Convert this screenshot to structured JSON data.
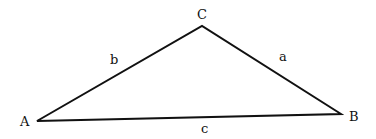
{
  "diagram": {
    "type": "triangle",
    "stroke_color": "#111111",
    "vertices": {
      "A": {
        "label": "A",
        "x": 37,
        "y": 121
      },
      "B": {
        "label": "B",
        "x": 341,
        "y": 114
      },
      "C": {
        "label": "C",
        "x": 202,
        "y": 26
      }
    },
    "sides": {
      "a": {
        "label": "a",
        "from": "C",
        "to": "B"
      },
      "b": {
        "label": "b",
        "from": "A",
        "to": "C"
      },
      "c": {
        "label": "c",
        "from": "A",
        "to": "B"
      }
    }
  }
}
